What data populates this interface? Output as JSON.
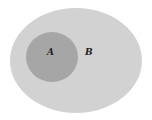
{
  "diagram": {
    "type": "venn-subset",
    "sets": [
      {
        "id": "B",
        "label": "B",
        "role": "universal/superset",
        "color": "#d2d2d2"
      },
      {
        "id": "A",
        "label": "A",
        "role": "subset of B",
        "color": "#a6a6a6"
      }
    ],
    "background": "#ffffff"
  }
}
